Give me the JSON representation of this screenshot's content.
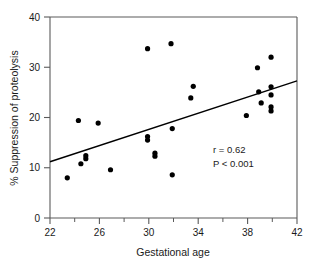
{
  "chart_data": {
    "type": "scatter",
    "title": "",
    "xlabel": "Gestational age",
    "ylabel": "% Suppression of proteolysis",
    "xlim": [
      22,
      42
    ],
    "ylim": [
      0,
      40
    ],
    "x_ticks": [
      22,
      26,
      30,
      34,
      38,
      42
    ],
    "x_tick_labels": [
      "22",
      "26",
      "30",
      "34",
      "38",
      "42"
    ],
    "x_minor_ticks": [
      24,
      28,
      32,
      36,
      40
    ],
    "y_ticks": [
      0,
      10,
      20,
      30,
      40
    ],
    "y_tick_labels": [
      "0",
      "10",
      "20",
      "30",
      "40"
    ],
    "grid": false,
    "legend": false,
    "marker": "filled-circle",
    "marker_color": "#000000",
    "points": [
      {
        "x": 23.4,
        "y": 8.0
      },
      {
        "x": 24.3,
        "y": 19.4
      },
      {
        "x": 24.5,
        "y": 10.8
      },
      {
        "x": 24.9,
        "y": 12.4
      },
      {
        "x": 24.9,
        "y": 11.8
      },
      {
        "x": 25.9,
        "y": 18.9
      },
      {
        "x": 26.9,
        "y": 9.6
      },
      {
        "x": 29.9,
        "y": 33.7
      },
      {
        "x": 29.9,
        "y": 16.2
      },
      {
        "x": 29.9,
        "y": 15.5
      },
      {
        "x": 30.5,
        "y": 12.9
      },
      {
        "x": 30.5,
        "y": 12.3
      },
      {
        "x": 31.8,
        "y": 34.7
      },
      {
        "x": 31.9,
        "y": 17.8
      },
      {
        "x": 31.9,
        "y": 8.6
      },
      {
        "x": 33.4,
        "y": 23.9
      },
      {
        "x": 33.6,
        "y": 26.2
      },
      {
        "x": 37.9,
        "y": 20.4
      },
      {
        "x": 38.8,
        "y": 29.9
      },
      {
        "x": 38.9,
        "y": 25.1
      },
      {
        "x": 39.1,
        "y": 22.9
      },
      {
        "x": 39.9,
        "y": 32.0
      },
      {
        "x": 39.9,
        "y": 26.1
      },
      {
        "x": 39.9,
        "y": 24.5
      },
      {
        "x": 39.9,
        "y": 22.1
      },
      {
        "x": 39.9,
        "y": 21.3
      }
    ],
    "fit_line": {
      "x_start": 22,
      "y_start": 11.2,
      "x_end": 42,
      "y_end": 27.3
    },
    "annotations": {
      "correlation": "r = 0.62",
      "pvalue": "P < 0.001"
    }
  }
}
